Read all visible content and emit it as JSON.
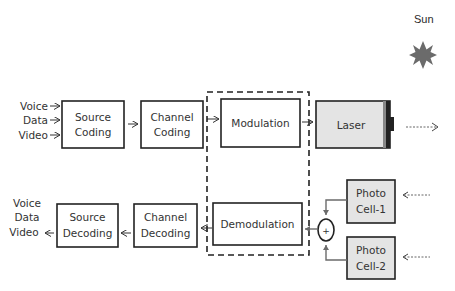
{
  "diagram": {
    "sun": {
      "label": "Sun",
      "icon": "sun-star-icon",
      "color": "#6b6b6b"
    },
    "inputs": [
      "Voice",
      "Data",
      "Video"
    ],
    "outputs": [
      "Voice",
      "Data",
      "Video"
    ],
    "transmitter": {
      "source_coding": [
        "Source",
        "Coding"
      ],
      "channel_coding": [
        "Channel",
        "Coding"
      ],
      "modulation": "Modulation",
      "laser": "Laser"
    },
    "receiver": {
      "source_decoding": [
        "Source",
        "Decoding"
      ],
      "channel_decoding": [
        "Channel",
        "Decoding"
      ],
      "demodulation": "Demodulation",
      "summer": "+",
      "photo_cell_1": [
        "Photo",
        "Cell-1"
      ],
      "photo_cell_2": [
        "Photo",
        "Cell-2"
      ]
    },
    "colors": {
      "box_fill": "#ffffff",
      "gray_box_fill": "#e4e4e4",
      "stroke": "#222222",
      "connector": "#6b6b6b"
    }
  }
}
